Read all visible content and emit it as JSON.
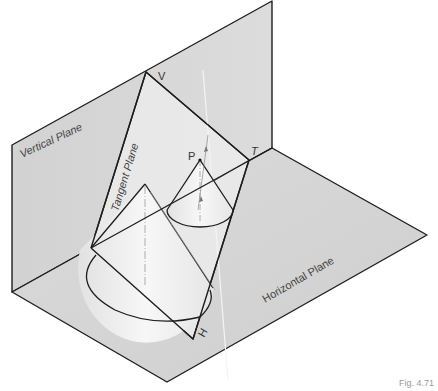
{
  "figure": {
    "caption": "Fig. 4.71",
    "labels": {
      "vertical_plane": "Vertical Plane",
      "horizontal_plane": "Horizontal Plane",
      "tangent_plane": "Tangent Plane",
      "point_v": "V",
      "point_t": "T",
      "point_h": "H",
      "point_p": "P"
    },
    "colors": {
      "plane_fill": "#d6d6d6",
      "tangent_fill": "#ebebeb",
      "cone_fill": "#f2f2f2",
      "line": "#1e1e1e",
      "background": "#ffffff"
    }
  }
}
